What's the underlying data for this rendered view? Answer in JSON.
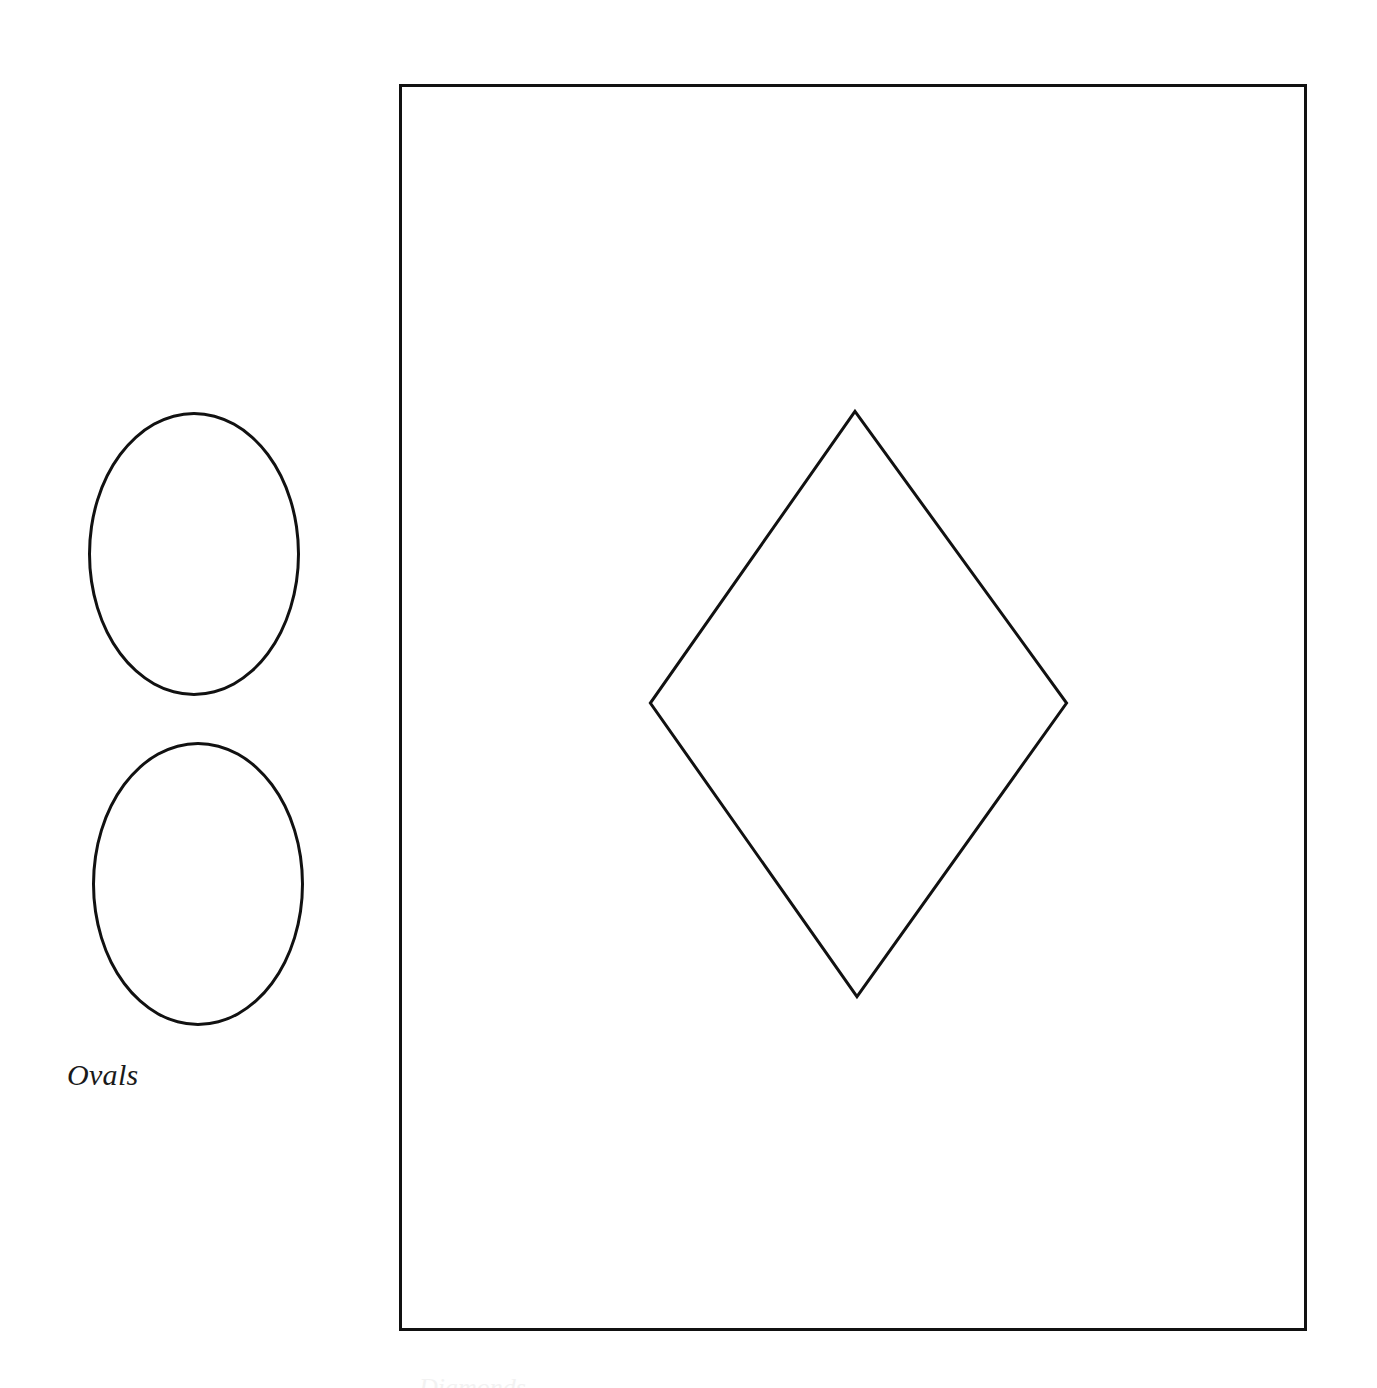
{
  "page": {
    "background_color": "#ffffff",
    "width": 1377,
    "height": 1388,
    "ink_color": "#111111"
  },
  "figure": {
    "ovals_group": {
      "caption": "Ovals",
      "shape_count": 2,
      "shapes": [
        {
          "name": "oval-upper",
          "type": "ellipse",
          "cx": 194,
          "cy": 554,
          "rx": 106,
          "ry": 142,
          "stroke": "#111111",
          "stroke_width": 3,
          "fill": "none"
        },
        {
          "name": "oval-lower",
          "type": "ellipse",
          "cx": 198,
          "cy": 884,
          "rx": 106,
          "ry": 142,
          "stroke": "#111111",
          "stroke_width": 3,
          "fill": "none"
        }
      ]
    },
    "plate": {
      "name": "framed-plate",
      "border_color": "#111111",
      "border_width": 3,
      "fill": "#ffffff",
      "x": 399,
      "y": 84,
      "width": 908,
      "height": 1247,
      "diamond": {
        "name": "diamond",
        "type": "polygon",
        "stroke": "#111111",
        "stroke_width": 3,
        "fill": "none",
        "points_abs": [
          [
            855,
            410
          ],
          [
            1068,
            703
          ],
          [
            857,
            998
          ],
          [
            649,
            703
          ]
        ],
        "points_local": "456,326 669,619 458,914 250,619"
      }
    },
    "bottom_caption": "Diamonds"
  }
}
